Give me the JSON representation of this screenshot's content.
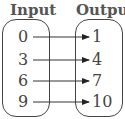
{
  "diagram": {
    "type": "mapping",
    "input_label": "Input",
    "output_label": "Output",
    "inputs": [
      "0",
      "3",
      "6",
      "9"
    ],
    "outputs": [
      "1",
      "4",
      "7",
      "10"
    ],
    "mappings": [
      [
        "0",
        "1"
      ],
      [
        "3",
        "4"
      ],
      [
        "6",
        "7"
      ],
      [
        "9",
        "10"
      ]
    ]
  }
}
